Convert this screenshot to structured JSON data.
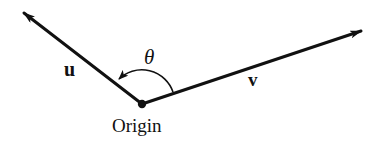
{
  "diagram": {
    "title": "",
    "colors": {
      "stroke": "#111111",
      "background": "#ffffff"
    },
    "origin": {
      "label": "Origin",
      "x": 142,
      "y": 104
    },
    "vectors": [
      {
        "name": "u",
        "label": "u",
        "from": [
          142,
          104
        ],
        "to": [
          22,
          12
        ]
      },
      {
        "name": "v",
        "label": "v",
        "from": [
          142,
          104
        ],
        "to": [
          363,
          31
        ]
      }
    ],
    "angle": {
      "label": "θ",
      "from_vector": "v",
      "to_vector": "u",
      "arc_direction": "counterclockwise"
    }
  }
}
